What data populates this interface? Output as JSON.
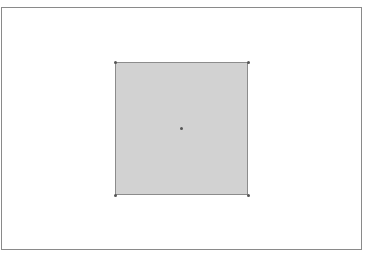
{
  "canvas": {
    "frame": {
      "x": 1,
      "y": 7,
      "width": 361,
      "height": 243,
      "stroke": "#8a8a8a"
    },
    "shape": {
      "type": "square",
      "x": 115,
      "y": 62,
      "width": 133,
      "height": 133,
      "fill": "#d2d2d2",
      "stroke": "#8c8c8c",
      "vertices": [
        [
          115,
          62
        ],
        [
          248,
          62
        ],
        [
          248,
          195
        ],
        [
          115,
          195
        ]
      ],
      "center": [
        181,
        128
      ]
    }
  }
}
